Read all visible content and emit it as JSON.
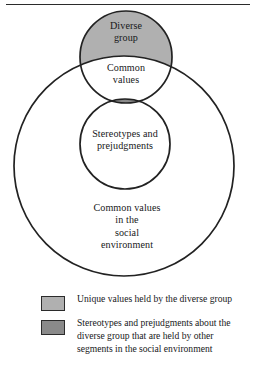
{
  "figure": {
    "type": "venn-diagram",
    "title": "",
    "top_rule": true,
    "circles": {
      "outer": {
        "name": "social-environment-circle",
        "label": "Common values\nin the\nsocial\nenvironment",
        "label_lines": [
          "Common values",
          "in the",
          "social",
          "environment"
        ],
        "fill": "#ffffff",
        "stroke": "#222222",
        "cx": 124,
        "cy": 166,
        "r": 110
      },
      "top": {
        "name": "diverse-group-circle",
        "label_upper": "Diverse\ngroup",
        "label_upper_lines": [
          "Diverse",
          "group"
        ],
        "label_lower": "Common\nvalues",
        "label_lower_lines": [
          "Common",
          "values"
        ],
        "fill_upper": "#b0b0b0",
        "fill_lower": "#ffffff",
        "stroke": "#222222",
        "cx": 126,
        "cy": 57,
        "r": 46
      },
      "middle": {
        "name": "stereotypes-circle",
        "label": "Stereotypes and\nprejudgments",
        "label_lines": [
          "Stereotypes and",
          "prejudgments"
        ],
        "fill": "#ffffff",
        "stroke": "#222222",
        "cx": 125,
        "cy": 144,
        "r": 45
      },
      "overlap_lens": {
        "name": "overlap-lens",
        "fill": "#8a8a8a",
        "stroke": "#222222"
      }
    },
    "labels": {
      "diverse_group": "Diverse\ngroup",
      "common_values": "Common\nvalues",
      "stereotypes": "Stereotypes and\nprejudgments",
      "social_environment": "Common values\nin the\nsocial\nenvironment"
    }
  },
  "legend": {
    "items": [
      {
        "swatch_name": "legend-swatch-unique-values",
        "color": "#b0b0b0",
        "text": "Unique values held by the diverse group"
      },
      {
        "swatch_name": "legend-swatch-stereotypes",
        "color": "#8a8a8a",
        "text": "Stereotypes and prejudgments about the diverse group that are held by other segments in the social environment"
      }
    ]
  }
}
